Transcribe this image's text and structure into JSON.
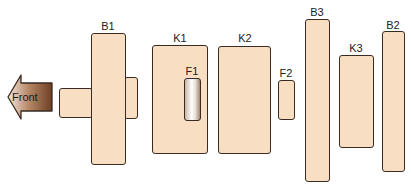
{
  "diagram": {
    "type": "fuse-relay-block-layout",
    "direction_arrow": {
      "label": "Front",
      "points": "left",
      "color": "#8b5a3c"
    },
    "components": [
      {
        "id": "B1",
        "label": "B1",
        "kind": "block"
      },
      {
        "id": "K1",
        "label": "K1",
        "kind": "relay"
      },
      {
        "id": "F1",
        "label": "F1",
        "kind": "fuse"
      },
      {
        "id": "K2",
        "label": "K2",
        "kind": "relay"
      },
      {
        "id": "F2",
        "label": "F2",
        "kind": "fuse"
      },
      {
        "id": "B3",
        "label": "B3",
        "kind": "block"
      },
      {
        "id": "K3",
        "label": "K3",
        "kind": "relay"
      },
      {
        "id": "B2",
        "label": "B2",
        "kind": "block"
      }
    ],
    "colors": {
      "component_fill": "#f8dfc3",
      "outline": "#3a2a22",
      "arrow": "#8b5a3c"
    }
  }
}
